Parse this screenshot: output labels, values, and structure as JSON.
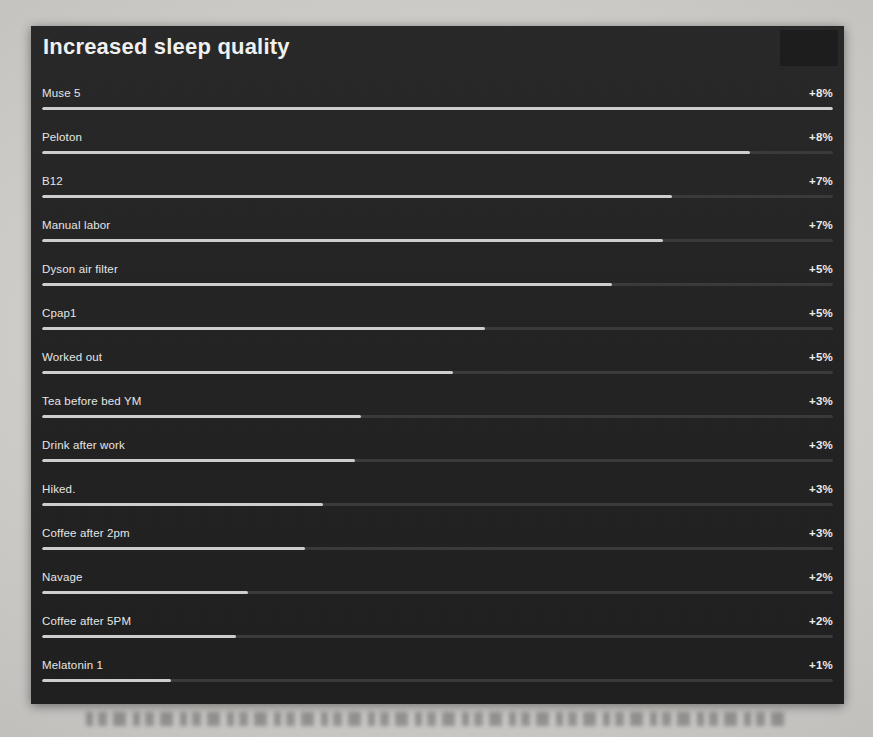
{
  "panel": {
    "title": "Increased sleep quality",
    "background_color": "#242424",
    "text_color": "#e8e8e8",
    "bar_fill_color": "#cfcfcf",
    "bar_track_color": "#3a3a3a"
  },
  "chart_data": {
    "type": "bar",
    "orientation": "horizontal",
    "title": "Increased sleep quality",
    "xlabel": "",
    "ylabel": "",
    "value_suffix": "%",
    "value_prefix": "+",
    "grid": false,
    "legend": false,
    "xlim": [
      0,
      8
    ],
    "categories": [
      "Muse 5",
      "Peloton",
      "B12",
      "Manual labor",
      "Dyson air filter",
      "Cpap1",
      "Worked out",
      "Tea before bed YM",
      "Drink after work",
      "Hiked.",
      "Coffee after 2pm",
      "Navage",
      "Coffee after 5PM",
      "Melatonin 1"
    ],
    "values": [
      8,
      8,
      7,
      7,
      5,
      5,
      5,
      3,
      3,
      3,
      3,
      2,
      2,
      1
    ],
    "value_labels": [
      "+8%",
      "+8%",
      "+7%",
      "+7%",
      "+5%",
      "+5%",
      "+5%",
      "+3%",
      "+3%",
      "+3%",
      "+3%",
      "+2%",
      "+2%",
      "+1%"
    ],
    "bar_fill_percent": [
      100.0,
      89.5,
      79.7,
      78.5,
      72.0,
      56.0,
      51.9,
      40.3,
      39.6,
      35.5,
      33.3,
      26.1,
      24.5,
      16.3
    ]
  },
  "rows": [
    {
      "label": "Muse 5",
      "value": "+8%",
      "fill": 100.0
    },
    {
      "label": "Peloton",
      "value": "+8%",
      "fill": 89.5
    },
    {
      "label": "B12",
      "value": "+7%",
      "fill": 79.7
    },
    {
      "label": "Manual labor",
      "value": "+7%",
      "fill": 78.5
    },
    {
      "label": "Dyson air filter",
      "value": "+5%",
      "fill": 72.0
    },
    {
      "label": "Cpap1",
      "value": "+5%",
      "fill": 56.0
    },
    {
      "label": "Worked out",
      "value": "+5%",
      "fill": 51.9
    },
    {
      "label": "Tea before bed YM",
      "value": "+3%",
      "fill": 40.3
    },
    {
      "label": "Drink after work",
      "value": "+3%",
      "fill": 39.6
    },
    {
      "label": "Hiked.",
      "value": "+3%",
      "fill": 35.5
    },
    {
      "label": "Coffee after 2pm",
      "value": "+3%",
      "fill": 33.3
    },
    {
      "label": "Navage",
      "value": "+2%",
      "fill": 26.1
    },
    {
      "label": "Coffee after 5PM",
      "value": "+2%",
      "fill": 24.5
    },
    {
      "label": "Melatonin 1",
      "value": "+1%",
      "fill": 16.3
    }
  ]
}
